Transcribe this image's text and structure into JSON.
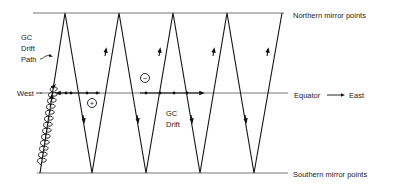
{
  "diagram": {
    "labels": {
      "northern": "Northern mirror points",
      "southern": "Southern mirror points",
      "equator": "Equator",
      "east": "East",
      "west": "West",
      "gc_drift_path_1": "GC",
      "gc_drift_path_2": "Drift",
      "gc_drift_path_3": "Path",
      "gc_drift_1": "GC",
      "gc_drift_2": "Drift",
      "ion_charge": "+",
      "electron_charge": "−"
    },
    "geometry": {
      "north_y": 13,
      "south_y": 173,
      "equator_y": 93,
      "top_vertices_x": [
        65,
        119,
        173,
        227,
        282
      ],
      "bottom_vertices_x": [
        40,
        92,
        146,
        200,
        254
      ]
    },
    "colors": {
      "line": "#111111",
      "mirror_line": "#777777",
      "text": "#222222"
    }
  }
}
